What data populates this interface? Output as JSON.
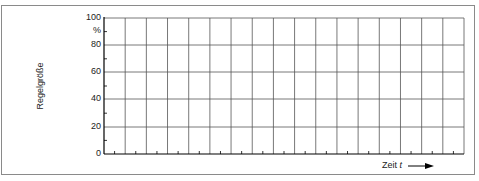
{
  "chart_data": {
    "type": "line",
    "title": "",
    "xlabel": "Zeit t",
    "ylabel": "Regelgröße",
    "y_unit": "%",
    "ylim": [
      0,
      100
    ],
    "yticks": [
      0,
      20,
      40,
      60,
      80,
      100
    ],
    "y_minor_ticks": [
      10,
      30,
      50,
      70,
      90
    ],
    "x_grid_columns": 17,
    "grid": true,
    "series": [],
    "note": "Empty grid for plotting controlled variable over time"
  },
  "labels": {
    "y100": "100",
    "yunit": "%",
    "y80": "80",
    "y60": "60",
    "y40": "40",
    "y20": "20",
    "y0": "0",
    "ylabel": "Regelgröße",
    "xlabel_prefix": "Zeit ",
    "xlabel_var": "t"
  }
}
